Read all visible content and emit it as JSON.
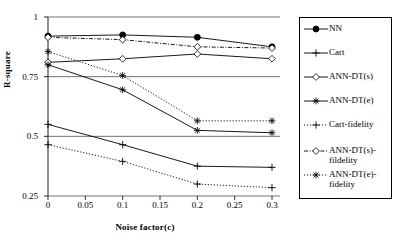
{
  "chart_data": {
    "type": "line",
    "title": "",
    "xlabel": "Noise factor(c)",
    "ylabel": "R-square",
    "x": [
      0,
      0.1,
      0.2,
      0.3
    ],
    "xticks": [
      "0",
      "0.05",
      "0.1",
      "0.15",
      "0.2",
      "0.25",
      "0.3"
    ],
    "xtick_values": [
      0,
      0.05,
      0.1,
      0.15,
      0.2,
      0.25,
      0.3
    ],
    "yticks": [
      "0.25",
      "0.5",
      "0.75",
      "1"
    ],
    "ytick_values": [
      0.25,
      0.5,
      0.75,
      1
    ],
    "xlim": [
      0,
      0.3
    ],
    "ylim": [
      0.25,
      1
    ],
    "grid": "horizontal",
    "legend_position": "right",
    "series": [
      {
        "name": "NN",
        "values": [
          0.92,
          0.925,
          0.915,
          0.875
        ],
        "marker": "filled-circle",
        "line": "solid",
        "color": "#000000"
      },
      {
        "name": "Cart",
        "values": [
          0.55,
          0.465,
          0.375,
          0.37
        ],
        "marker": "plus",
        "line": "solid",
        "color": "#000000"
      },
      {
        "name": "ANN-DT(s)",
        "values": [
          0.81,
          0.825,
          0.845,
          0.825
        ],
        "marker": "open-diamond",
        "line": "solid",
        "color": "#000000"
      },
      {
        "name": "ANN-DT(e)",
        "values": [
          0.8,
          0.695,
          0.525,
          0.515
        ],
        "marker": "asterisk",
        "line": "solid",
        "color": "#000000"
      },
      {
        "name": "Cart-fidelity",
        "values": [
          0.465,
          0.395,
          0.3,
          0.285
        ],
        "marker": "plus",
        "line": "dotted",
        "color": "#000000"
      },
      {
        "name": "ANN-DT(s)-fildelity",
        "values": [
          0.915,
          0.905,
          0.875,
          0.87
        ],
        "marker": "open-diamond",
        "line": "dash-dot",
        "color": "#000000"
      },
      {
        "name": "ANN-DT(e)-fidelity",
        "values": [
          0.855,
          0.755,
          0.565,
          0.565
        ],
        "marker": "asterisk",
        "line": "dotted",
        "color": "#000000"
      }
    ]
  },
  "legend": {
    "items": [
      {
        "label": "NN",
        "label2": ""
      },
      {
        "label": "Cart",
        "label2": ""
      },
      {
        "label": "ANN-DT(s)",
        "label2": ""
      },
      {
        "label": "ANN-DT(e)",
        "label2": ""
      },
      {
        "label": "Cart-fidelity",
        "label2": ""
      },
      {
        "label": "ANN-DT(s)-",
        "label2": "fildelity"
      },
      {
        "label": "ANN-DT(e)-",
        "label2": "fidelity"
      }
    ]
  },
  "axes": {
    "y_title": "R-square",
    "x_title": "Noise factor(c)"
  }
}
